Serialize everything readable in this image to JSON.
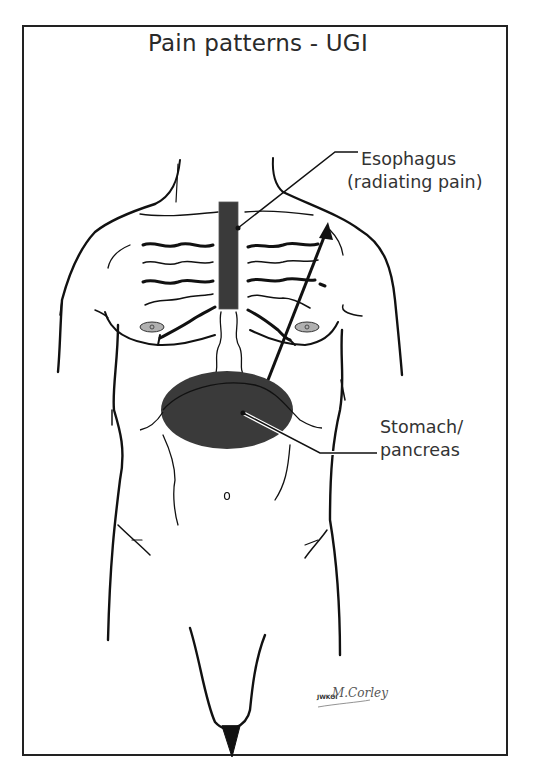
{
  "title": "Pain patterns - UGI",
  "labels": {
    "esophagus": {
      "line1": "Esophagus",
      "line2": "(radiating pain)"
    },
    "stomach_pancreas": {
      "line1": "Stomach/",
      "line2": "pancreas"
    }
  },
  "signature": {
    "initials": "JWKOI",
    "script": "M.Corley"
  },
  "highlight_regions": [
    {
      "name": "esophagus",
      "shape": "rectangle",
      "color": "#3a3a3a"
    },
    {
      "name": "stomach-pancreas",
      "shape": "ellipse",
      "color": "#3a3a3a"
    }
  ],
  "colors": {
    "outline": "#111111",
    "region_fill": "#3a3a3a",
    "nipple_fill": "#b0b0b0",
    "text": "#2a2a2a"
  }
}
